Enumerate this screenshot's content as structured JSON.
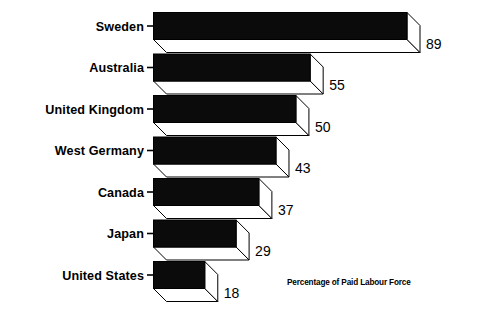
{
  "chart_data": {
    "type": "bar",
    "orientation": "horizontal",
    "style": "3d-isometric-bars",
    "title": "",
    "subtitle": "",
    "xlabel": "Percentage of Paid Labour Force",
    "ylabel": "",
    "annotation": "Percentage of Paid Labour Force",
    "categories": [
      "Sweden",
      "Australia",
      "United Kingdom",
      "West Germany",
      "Canada",
      "Japan",
      "United States"
    ],
    "values": [
      89,
      55,
      50,
      43,
      37,
      29,
      18
    ],
    "value_labels": [
      "89",
      "55",
      "50",
      "43",
      "37",
      "29",
      "18"
    ],
    "units": "percent",
    "xlim": [
      0,
      89
    ],
    "grid": false,
    "legend": false,
    "legend_position": "none",
    "colors": {
      "bar_front": "#0b0b0b",
      "bar_side": "#ffffff",
      "bar_outline": "#000000",
      "background": "#ffffff",
      "text": "#000000"
    }
  },
  "axis_note": {
    "text": "Percentage of Paid Labour Force"
  },
  "rows": [
    {
      "label": "Sweden",
      "value": 89,
      "value_label": "89"
    },
    {
      "label": "Australia",
      "value": 55,
      "value_label": "55"
    },
    {
      "label": "United Kingdom",
      "value": 50,
      "value_label": "50"
    },
    {
      "label": "West Germany",
      "value": 43,
      "value_label": "43"
    },
    {
      "label": "Canada",
      "value": 37,
      "value_label": "37"
    },
    {
      "label": "Japan",
      "value": 29,
      "value_label": "29"
    },
    {
      "label": "United States",
      "value": 18,
      "value_label": "18"
    }
  ]
}
